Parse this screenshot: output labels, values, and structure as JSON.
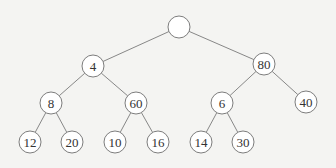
{
  "diagram": {
    "type": "binary-tree",
    "nodes": [
      {
        "id": "root",
        "label": "",
        "x": 179,
        "y": 27,
        "r": 11
      },
      {
        "id": "n4",
        "label": "4",
        "x": 93,
        "y": 66,
        "r": 11
      },
      {
        "id": "n80",
        "label": "80",
        "x": 264,
        "y": 64,
        "r": 11
      },
      {
        "id": "n8",
        "label": "8",
        "x": 51,
        "y": 103,
        "r": 11
      },
      {
        "id": "n60",
        "label": "60",
        "x": 136,
        "y": 103,
        "r": 11
      },
      {
        "id": "n6",
        "label": "6",
        "x": 222,
        "y": 103,
        "r": 11
      },
      {
        "id": "n40",
        "label": "40",
        "x": 306,
        "y": 102,
        "r": 11
      },
      {
        "id": "n12",
        "label": "12",
        "x": 30,
        "y": 142,
        "r": 11
      },
      {
        "id": "n20",
        "label": "20",
        "x": 72,
        "y": 142,
        "r": 11
      },
      {
        "id": "n10",
        "label": "10",
        "x": 115,
        "y": 142,
        "r": 11
      },
      {
        "id": "n16",
        "label": "16",
        "x": 158,
        "y": 142,
        "r": 11
      },
      {
        "id": "n14",
        "label": "14",
        "x": 201,
        "y": 142,
        "r": 11
      },
      {
        "id": "n30",
        "label": "30",
        "x": 243,
        "y": 142,
        "r": 11
      }
    ],
    "edges": [
      [
        "root",
        "n4"
      ],
      [
        "root",
        "n80"
      ],
      [
        "n4",
        "n8"
      ],
      [
        "n4",
        "n60"
      ],
      [
        "n80",
        "n6"
      ],
      [
        "n80",
        "n40"
      ],
      [
        "n8",
        "n12"
      ],
      [
        "n8",
        "n20"
      ],
      [
        "n60",
        "n10"
      ],
      [
        "n60",
        "n16"
      ],
      [
        "n6",
        "n14"
      ],
      [
        "n6",
        "n30"
      ]
    ]
  }
}
